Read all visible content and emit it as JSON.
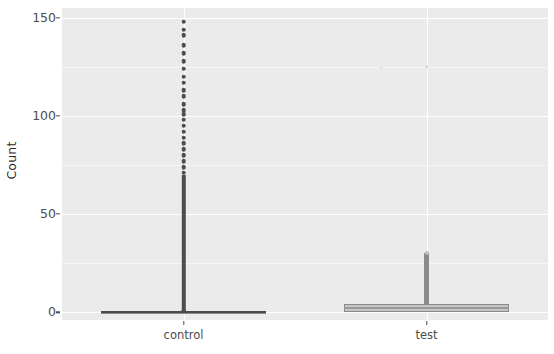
{
  "chart_data": {
    "type": "box",
    "title": "",
    "xlabel": "",
    "ylabel": "Count",
    "ylim": [
      -4,
      155
    ],
    "y_ticks": [
      0,
      50,
      100,
      150
    ],
    "y_tick_labels": [
      "0",
      "50",
      "100",
      "150"
    ],
    "y_minor_ticks": [
      25,
      75,
      125
    ],
    "grid": true,
    "legend": "none",
    "categories": [
      "control",
      "test"
    ],
    "series": [
      {
        "name": "control",
        "q1": 0,
        "median": 0,
        "q3": 0,
        "whisker_low": 0,
        "whisker_high": 1,
        "box_fill": "#c6c6c6",
        "box_border": "#8a8a8a",
        "outliers": [
          148,
          144,
          141,
          136,
          132,
          128,
          124,
          120,
          117,
          113,
          110,
          106,
          103,
          101,
          98,
          95,
          92,
          89,
          86,
          83,
          80,
          77,
          74,
          71,
          68,
          65,
          62,
          59,
          56,
          53,
          50,
          47,
          44,
          41,
          38,
          35,
          32,
          29,
          26,
          23,
          21,
          19,
          17,
          15,
          13,
          11,
          9,
          8,
          7,
          6,
          5,
          4,
          3,
          2
        ]
      },
      {
        "name": "test",
        "q1": 0,
        "median": 2,
        "q3": 4,
        "whisker_low": 0,
        "whisker_high": 30,
        "box_fill": "#c6c6c6",
        "box_border": "#8a8a8a",
        "outliers": [
          125
        ]
      }
    ],
    "colors": {
      "panel_background": "#ebebeb",
      "grid_major": "#ffffff",
      "grid_minor": "#f6f6f6",
      "axis_text": "#4d4d4d",
      "axis_title": "#2b2b2b",
      "outlier": "#4d4d4d",
      "plot_background": "#ffffff"
    }
  },
  "axis": {
    "y_title": "Count",
    "y_labels": [
      "0",
      "50",
      "100",
      "150"
    ],
    "x_labels": [
      "control",
      "test"
    ]
  }
}
